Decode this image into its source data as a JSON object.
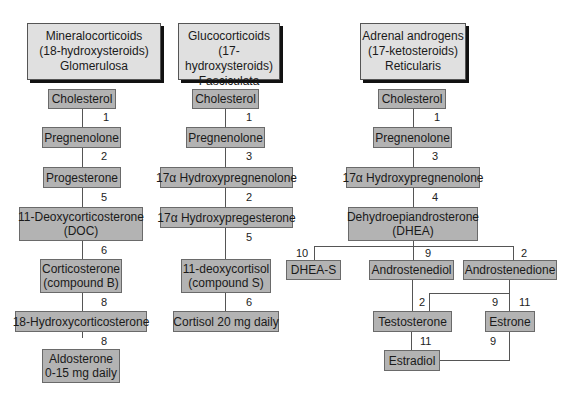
{
  "headers": {
    "mineral": {
      "line1": "Mineralocorticoids",
      "line2": "(18-hydroxysteroids)",
      "line3": "Glomerulosa"
    },
    "gluco": {
      "line1": "Glucocorticoids",
      "line2": "(17-hydroxysteroids)",
      "line3": "Fasciculata"
    },
    "androgen": {
      "line1": "Adrenal androgens",
      "line2": "(17-ketosteroids)",
      "line3": "Reticularis"
    }
  },
  "col1": {
    "cholesterol": "Cholesterol",
    "pregnenolone": "Pregnenolone",
    "progesterone": "Progesterone",
    "doc_line1": "11-Deoxycorticosterone",
    "doc_line2": "(DOC)",
    "cortico_line1": "Corticosterone",
    "cortico_line2": "(compound B)",
    "hydroxycortico": "18-Hydroxycorticosterone",
    "aldo_line1": "Aldosterone",
    "aldo_line2": "0-15 mg daily",
    "steps": [
      "1",
      "2",
      "5",
      "6",
      "8",
      "8"
    ]
  },
  "col2": {
    "cholesterol": "Cholesterol",
    "pregnenolone": "Pregnenolone",
    "hydroxypreg": "17α Hydroxypregnenolone",
    "hydroxyprog": "17α Hydroxypregesterone",
    "deoxycortisol_line1": "11-deoxycortisol",
    "deoxycortisol_line2": "(compound S)",
    "cortisol": "Cortisol 20 mg daily",
    "steps": [
      "1",
      "3",
      "2",
      "5",
      "6"
    ]
  },
  "col3": {
    "cholesterol": "Cholesterol",
    "pregnenolone": "Pregnenolone",
    "hydroxypreg": "17α Hydroxypregnenolone",
    "dhea_line1": "Dehydroepiandrosterone",
    "dhea_line2": "(DHEA)",
    "dheas": "DHEA-S",
    "androstenediol": "Androstenediol",
    "androstenedione": "Androstenedione",
    "testosterone": "Testosterone",
    "estrone": "Estrone",
    "estradiol": "Estradiol",
    "steps": {
      "chol_preg": "1",
      "preg_hp": "3",
      "hp_dhea": "4",
      "to_dheas": "10",
      "to_diol": "9",
      "to_dione": "2",
      "diol_testo": "2",
      "dione_testo": "9",
      "dione_estrone": "11",
      "testo_estradiol": "11",
      "estrone_estradiol": "9"
    }
  },
  "colors": {
    "box_fill": "#b3b3b3",
    "header_fill": "#e0e0e0",
    "line": "#555555"
  }
}
